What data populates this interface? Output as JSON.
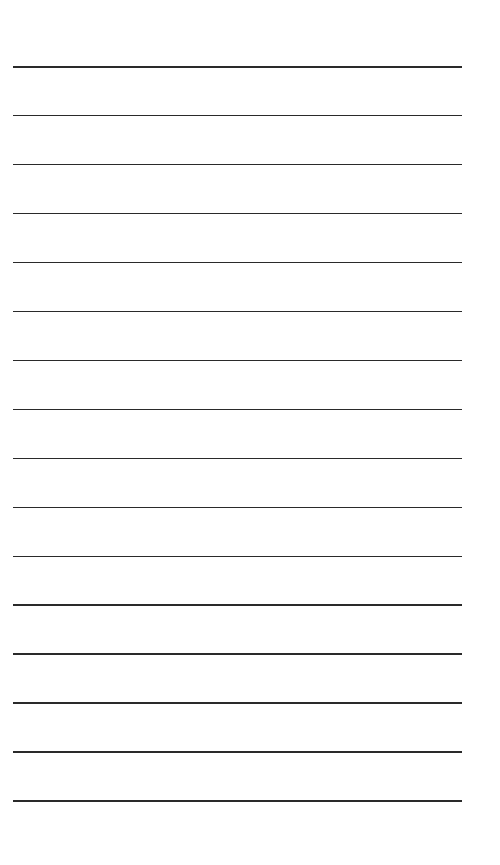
{
  "page": {
    "type": "lined-paper",
    "background_color": "#ffffff",
    "line_color": "#2a2a2a",
    "line_count": 16,
    "first_line_y": 66,
    "line_spacing": 48.95,
    "line_left": 13,
    "line_width": 449
  }
}
